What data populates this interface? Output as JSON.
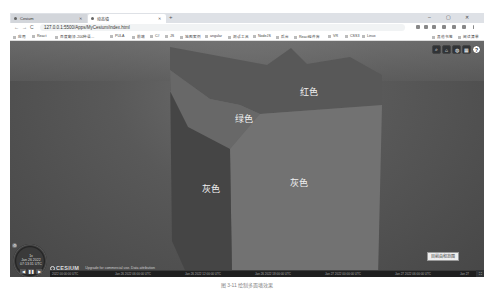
{
  "browser": {
    "tabs": [
      {
        "label": "Cesium",
        "active": false
      },
      {
        "label": "动态墙",
        "active": true
      }
    ],
    "new_tab": "+",
    "window_controls": {
      "minimize": "–",
      "restore": "▢",
      "close": "✕"
    },
    "nav": {
      "back": "←",
      "forward": "→",
      "reload": "C"
    },
    "url": "127.0.0.1:5500/Apps/MyCesium/index.html",
    "bookmarks": [
      "应用",
      "React",
      "百度翻译-200种语...",
      "PULA",
      "前端",
      "C#",
      "JS",
      "地图案例",
      "angular",
      "测试工具",
      "NodeJS",
      "后台",
      "React组件库",
      "VR",
      "CSS3",
      "Linux"
    ],
    "bookmarks_right": [
      "其他书签",
      "阅读清单"
    ]
  },
  "viewer": {
    "toolbar": [
      {
        "name": "geocoder-search",
        "glyph": "🔍"
      },
      {
        "name": "home",
        "glyph": "⌂"
      },
      {
        "name": "scene-mode",
        "glyph": "◍"
      },
      {
        "name": "base-layer-picker",
        "glyph": "▦"
      },
      {
        "name": "help",
        "glyph": "?"
      }
    ],
    "wall_labels": {
      "red": "红色",
      "green": "绿色",
      "gray_left": "灰色",
      "gray_front": "灰色"
    },
    "colors": {
      "wall_top": "#555555",
      "wall_green": "#6a6a6a",
      "wall_front": "#707070",
      "wall_left": "#3f3f3f"
    },
    "range_button": "目前由和范围",
    "animation": {
      "speed": "1x",
      "date": "Jan 26 2022",
      "time": "07:13:31 UTC",
      "buttons": [
        "◀",
        "❚❚",
        "▶"
      ]
    },
    "credits": {
      "logo": "CESIUM",
      "text": "Upgrade for commercial use. Data attribution"
    },
    "timeline_ticks": [
      "2022 00:00:00 UTC",
      "Jan 26 2022 06:00:00 UTC",
      "Jan 26 2022 12:00:00 UTC",
      "Jan 26 2022 18:00:00 UTC",
      "Jan 27 2022 00:00:00 UTC",
      "Jan 27 2022 06:00:00 UTC",
      "Jan 27"
    ],
    "fullscreen": "⛶"
  },
  "caption": "图 3-11  绘制多面墙效果"
}
